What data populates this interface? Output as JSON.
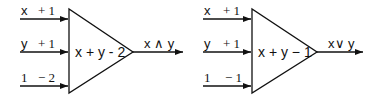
{
  "perceptrons": [
    {
      "name": "and",
      "inputs": [
        {
          "label": "x",
          "weight": "+ 1"
        },
        {
          "label": "y",
          "weight": "+ 1"
        },
        {
          "label": "1",
          "weight": "− 2"
        }
      ],
      "expression": "x + y - 2",
      "output": "x ∧ y"
    },
    {
      "name": "or",
      "inputs": [
        {
          "label": "x",
          "weight": "+ 1"
        },
        {
          "label": "y",
          "weight": "+ 1"
        },
        {
          "label": "1",
          "weight": "− 1"
        }
      ],
      "expression": "x + y − 1",
      "output": "x∨ y"
    }
  ],
  "colors": {
    "stroke": "#111111",
    "background": "#ffffff"
  }
}
